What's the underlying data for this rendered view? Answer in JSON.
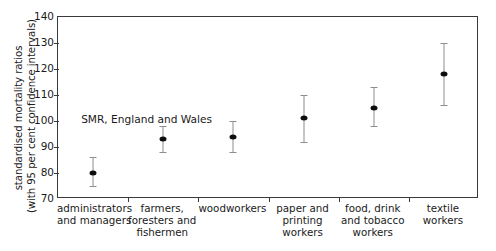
{
  "chart_data": {
    "type": "scatter",
    "title": "",
    "subtitle": "",
    "xlabel": "",
    "ylabel_lines": [
      "standardised mortality ratios",
      "(with 95 per cent confidence intervals)"
    ],
    "ylabel": "standardised mortality ratios (with 95 per cent confidence intervals)",
    "ylim": [
      70,
      140
    ],
    "yticks": [
      70,
      80,
      90,
      100,
      110,
      120,
      130,
      140
    ],
    "grid": false,
    "legend": false,
    "legend_position": "none",
    "annotations": [
      {
        "text": "SMR, England and Wales",
        "x_frac": 0.055,
        "y_value": 100.6
      }
    ],
    "categories": [
      "administrators and managers",
      "farmers, foresters and fishermen",
      "woodworkers",
      "paper and printing workers",
      "food, drink and tobacco workers",
      "textile workers"
    ],
    "category_label_lines": [
      [
        "administrators",
        "and managers"
      ],
      [
        "farmers,",
        "foresters and",
        "fishermen"
      ],
      [
        "woodworkers"
      ],
      [
        "paper and",
        "printing",
        "workers"
      ],
      [
        "food, drink",
        "and tobacco",
        "workers"
      ],
      [
        "textile",
        "workers"
      ]
    ],
    "values": [
      80,
      93,
      94,
      101,
      105,
      118
    ],
    "ci_low": [
      75,
      88,
      88,
      92,
      98,
      106
    ],
    "ci_high": [
      86,
      98,
      100,
      110,
      113,
      130
    ],
    "points": [
      {
        "category": "administrators and managers",
        "smr": 80,
        "ci_low": 75,
        "ci_high": 86
      },
      {
        "category": "farmers, foresters and fishermen",
        "smr": 93,
        "ci_low": 88,
        "ci_high": 98
      },
      {
        "category": "woodworkers",
        "smr": 94,
        "ci_low": 88,
        "ci_high": 100
      },
      {
        "category": "paper and printing workers",
        "smr": 101,
        "ci_low": 92,
        "ci_high": 110
      },
      {
        "category": "food, drink and tobacco workers",
        "smr": 105,
        "ci_low": 98,
        "ci_high": 113
      },
      {
        "category": "textile workers",
        "smr": 118,
        "ci_low": 106,
        "ci_high": 130
      }
    ],
    "colors": {
      "point": "#0d0d0d",
      "errorbar": "#8e8e8e",
      "axis": "#3a3a3a",
      "text": "#1a1a1a",
      "background": "#ffffff"
    }
  }
}
